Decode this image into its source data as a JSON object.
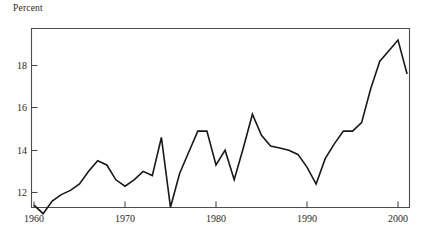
{
  "chart_data": {
    "type": "line",
    "title": "",
    "subtitle": "",
    "ylabel": "Percent",
    "xlabel": "",
    "ylim": [
      10.3,
      19.8
    ],
    "xlim": [
      1960,
      2001
    ],
    "grid": false,
    "legend": "none",
    "y_ticks": [
      12,
      14,
      16,
      18
    ],
    "y_tick_labels": [
      "12",
      "14",
      "16",
      "18"
    ],
    "x_ticks": [
      1960,
      1970,
      1980,
      1990,
      2000
    ],
    "x_tick_labels": [
      "1960",
      "1970",
      "1980",
      "1990",
      "2000"
    ],
    "line_color": "#1a1718",
    "axis_color": "#4f4b49",
    "series": [
      {
        "name": "Percent",
        "x": [
          1960,
          1961,
          1962,
          1963,
          1964,
          1965,
          1966,
          1967,
          1968,
          1969,
          1970,
          1971,
          1972,
          1973,
          1974,
          1975,
          1976,
          1977,
          1978,
          1979,
          1980,
          1981,
          1982,
          1983,
          1984,
          1985,
          1986,
          1987,
          1988,
          1989,
          1990,
          1991,
          1992,
          1993,
          1994,
          1995,
          1996,
          1997,
          1998,
          1999,
          2000,
          2001
        ],
        "values": [
          11.4,
          11.0,
          11.6,
          11.9,
          12.1,
          12.4,
          13.0,
          13.5,
          13.3,
          12.6,
          12.3,
          12.6,
          13.0,
          12.8,
          14.6,
          11.3,
          12.9,
          13.9,
          14.9,
          14.9,
          13.3,
          14.0,
          12.6,
          14.1,
          15.7,
          14.7,
          14.2,
          14.1,
          14.0,
          13.8,
          13.2,
          12.4,
          13.6,
          14.3,
          14.9,
          14.9,
          15.3,
          16.9,
          18.2,
          18.7,
          19.2,
          17.6
        ]
      }
    ]
  },
  "axes": {
    "ylabel": "Percent",
    "y_tick_labels": [
      "18",
      "16",
      "14",
      "12"
    ],
    "x_tick_labels": [
      "1960",
      "1970",
      "1980",
      "1990",
      "2000"
    ]
  }
}
